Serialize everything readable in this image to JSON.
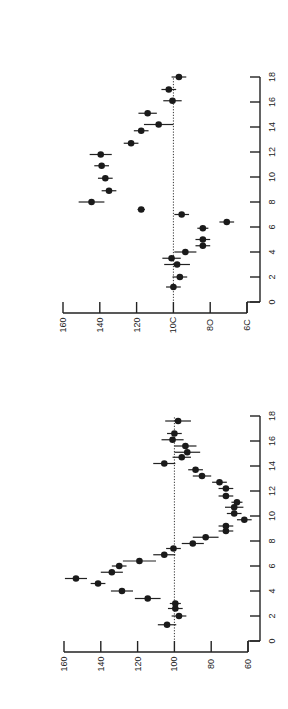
{
  "figure": {
    "orientation": "rotated 90 degrees counter-clockwise (value axis horizontal, time axis vertical)",
    "panels": 2
  },
  "chart_data": [
    {
      "type": "scatter",
      "panel": "upper",
      "title": "",
      "xlabel": "",
      "ylabel": "",
      "x_ticks": [
        "0",
        "2",
        "4",
        "6",
        "8",
        "10",
        "12",
        "14",
        "16",
        "18"
      ],
      "y_ticks": [
        "160",
        "140",
        "120",
        "10C",
        "8O",
        "6C"
      ],
      "xlim": [
        0,
        18
      ],
      "ylim": [
        60,
        160
      ],
      "reference_line": 100,
      "grid": false,
      "error_bars": "horizontal (value direction)",
      "points": [
        {
          "x": 1.2,
          "y": 100,
          "err": 4
        },
        {
          "x": 2.0,
          "y": 96.5,
          "err": 4
        },
        {
          "x": 3.0,
          "y": 98,
          "err": 7
        },
        {
          "x": 3.5,
          "y": 101,
          "err": 5
        },
        {
          "x": 4.0,
          "y": 93.5,
          "err": 6
        },
        {
          "x": 4.5,
          "y": 84,
          "err": 4
        },
        {
          "x": 5.0,
          "y": 84,
          "err": 4
        },
        {
          "x": 5.9,
          "y": 84,
          "err": 3
        },
        {
          "x": 6.4,
          "y": 71,
          "err": 4
        },
        {
          "x": 7.0,
          "y": 95.5,
          "err": 4
        },
        {
          "x": 7.4,
          "y": 117.5,
          "err": 2
        },
        {
          "x": 8.0,
          "y": 144.5,
          "err": 7
        },
        {
          "x": 8.9,
          "y": 135,
          "err": 4
        },
        {
          "x": 9.9,
          "y": 137,
          "err": 4
        },
        {
          "x": 10.9,
          "y": 139,
          "err": 4
        },
        {
          "x": 11.8,
          "y": 139.5,
          "err": 6
        },
        {
          "x": 12.7,
          "y": 123,
          "err": 4
        },
        {
          "x": 13.7,
          "y": 117.5,
          "err": 4
        },
        {
          "x": 14.2,
          "y": 108,
          "err": 8
        },
        {
          "x": 15.1,
          "y": 114,
          "err": 5
        },
        {
          "x": 16.1,
          "y": 100.5,
          "err": 5
        },
        {
          "x": 17.0,
          "y": 102.5,
          "err": 4
        },
        {
          "x": 18.0,
          "y": 97,
          "err": 4
        }
      ]
    },
    {
      "type": "scatter",
      "panel": "lower",
      "title": "",
      "xlabel": "",
      "ylabel": "",
      "x_ticks": [
        "0",
        "2",
        "4",
        "6",
        "8",
        "10",
        "12",
        "14",
        "16",
        "18"
      ],
      "y_ticks": [
        "160",
        "140",
        "120",
        "100",
        "80",
        "60"
      ],
      "xlim": [
        0,
        18
      ],
      "ylim": [
        60,
        160
      ],
      "reference_line": 100,
      "grid": false,
      "error_bars": "horizontal (value direction)",
      "points": [
        {
          "x": 1.3,
          "y": 104,
          "err": 5
        },
        {
          "x": 2.0,
          "y": 97.5,
          "err": 4
        },
        {
          "x": 2.6,
          "y": 99.5,
          "err": 4
        },
        {
          "x": 3.0,
          "y": 99.5,
          "err": 3
        },
        {
          "x": 3.4,
          "y": 114.5,
          "err": 7
        },
        {
          "x": 4.0,
          "y": 128.5,
          "err": 6
        },
        {
          "x": 4.6,
          "y": 141.5,
          "err": 4
        },
        {
          "x": 5.0,
          "y": 153.5,
          "err": 6
        },
        {
          "x": 5.5,
          "y": 134,
          "err": 6
        },
        {
          "x": 6.0,
          "y": 130,
          "err": 4
        },
        {
          "x": 6.4,
          "y": 119,
          "err": 9
        },
        {
          "x": 6.9,
          "y": 105.5,
          "err": 6
        },
        {
          "x": 7.4,
          "y": 100.5,
          "err": 4
        },
        {
          "x": 7.8,
          "y": 90,
          "err": 6
        },
        {
          "x": 8.3,
          "y": 83,
          "err": 7
        },
        {
          "x": 8.8,
          "y": 72,
          "err": 4
        },
        {
          "x": 9.2,
          "y": 72,
          "err": 4
        },
        {
          "x": 9.7,
          "y": 62,
          "err": 4
        },
        {
          "x": 10.2,
          "y": 67.5,
          "err": 4
        },
        {
          "x": 10.7,
          "y": 67.5,
          "err": 5
        },
        {
          "x": 11.1,
          "y": 66,
          "err": 3
        },
        {
          "x": 11.6,
          "y": 72,
          "err": 4
        },
        {
          "x": 12.2,
          "y": 72,
          "err": 4
        },
        {
          "x": 12.7,
          "y": 75.5,
          "err": 4
        },
        {
          "x": 13.2,
          "y": 85,
          "err": 5
        },
        {
          "x": 13.7,
          "y": 88.5,
          "err": 4
        },
        {
          "x": 14.2,
          "y": 105.5,
          "err": 6
        },
        {
          "x": 14.7,
          "y": 96,
          "err": 5
        },
        {
          "x": 15.1,
          "y": 93,
          "err": 7
        },
        {
          "x": 15.6,
          "y": 94,
          "err": 6
        },
        {
          "x": 16.1,
          "y": 101,
          "err": 6
        },
        {
          "x": 16.6,
          "y": 100,
          "err": 4
        },
        {
          "x": 17.6,
          "y": 98,
          "err": 7
        }
      ]
    }
  ],
  "layout": {
    "panels": [
      {
        "value_px_at_160": 63,
        "value_px_at_60": 247,
        "time_px_at_0": 302,
        "time_px_at_18": 77,
        "time_axis_x": 260,
        "value_axis_y": 313
      },
      {
        "value_px_at_160": 64,
        "value_px_at_60": 248,
        "time_px_at_0": 641,
        "time_px_at_18": 416,
        "time_axis_x": 260,
        "value_axis_y": 652
      }
    ]
  }
}
